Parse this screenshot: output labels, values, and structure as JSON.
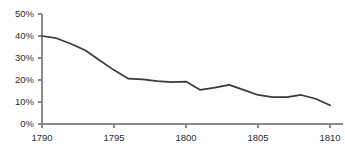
{
  "chart_data": {
    "type": "line",
    "title": "",
    "subtitle": "",
    "xlabel": "",
    "ylabel": "",
    "xlim": [
      1790,
      1810
    ],
    "ylim": [
      0,
      50
    ],
    "grid": false,
    "legend": false,
    "legend_position": "none",
    "line_color": "#3a3a3a",
    "axis_color": "#8a8a8a",
    "background_color": "#fefefe",
    "y_tick_labels": [
      "0%",
      "10%",
      "20%",
      "30%",
      "40%",
      "50%"
    ],
    "y_tick_values": [
      0,
      10,
      20,
      30,
      40,
      50
    ],
    "x_tick_labels": [
      "1790",
      "1795",
      "1800",
      "1805",
      "1810"
    ],
    "x_tick_values": [
      1790,
      1795,
      1800,
      1805,
      1810
    ],
    "x": [
      1790,
      1791,
      1792,
      1793,
      1794,
      1795,
      1796,
      1797,
      1798,
      1799,
      1800,
      1801,
      1802,
      1803,
      1804,
      1805,
      1806,
      1807,
      1808,
      1809,
      1810
    ],
    "values": [
      40.0,
      39.0,
      36.5,
      33.5,
      29.0,
      24.5,
      20.6,
      20.3,
      19.5,
      19.0,
      19.3,
      15.5,
      16.5,
      17.8,
      15.5,
      13.2,
      12.2,
      12.2,
      13.2,
      11.5,
      8.5
    ],
    "series": [
      {
        "name": "series-1",
        "color": "#3a3a3a",
        "values": [
          40.0,
          39.0,
          36.5,
          33.5,
          29.0,
          24.5,
          20.6,
          20.3,
          19.5,
          19.0,
          19.3,
          15.5,
          16.5,
          17.8,
          15.5,
          13.2,
          12.2,
          12.2,
          13.2,
          11.5,
          8.5
        ]
      }
    ]
  }
}
